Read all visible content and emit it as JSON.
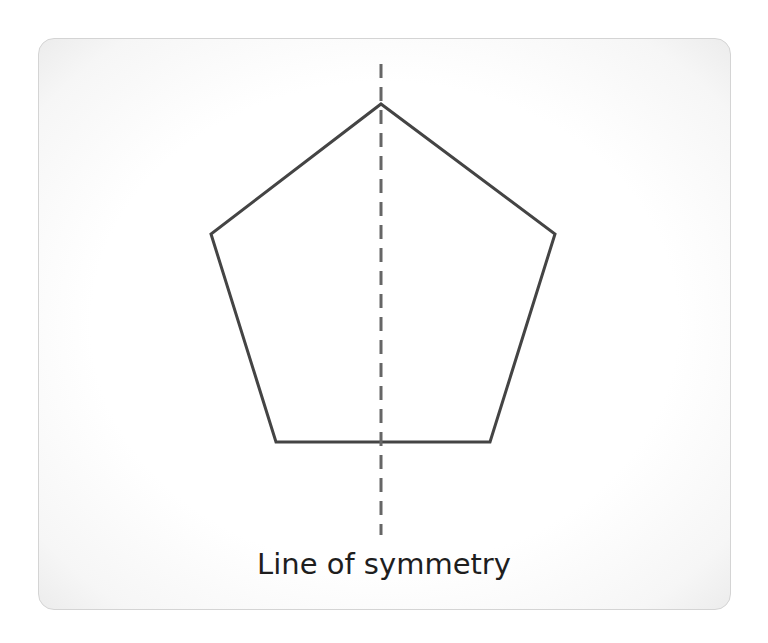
{
  "diagram": {
    "caption": "Line of symmetry",
    "shape": {
      "type": "pentagon",
      "vertices": [
        [
          381,
          104
        ],
        [
          555,
          234
        ],
        [
          490,
          442
        ],
        [
          276,
          442
        ],
        [
          211,
          234
        ]
      ],
      "stroke_color": "#444444",
      "stroke_width": 3
    },
    "symmetry_line": {
      "x": 381,
      "y_start": 64,
      "y_end": 535,
      "style": "dashed",
      "dash": [
        14,
        9
      ],
      "stroke_color": "#666666",
      "stroke_width": 3
    },
    "card": {
      "border_color": "#d4d4d4",
      "background": "#ffffff"
    }
  }
}
